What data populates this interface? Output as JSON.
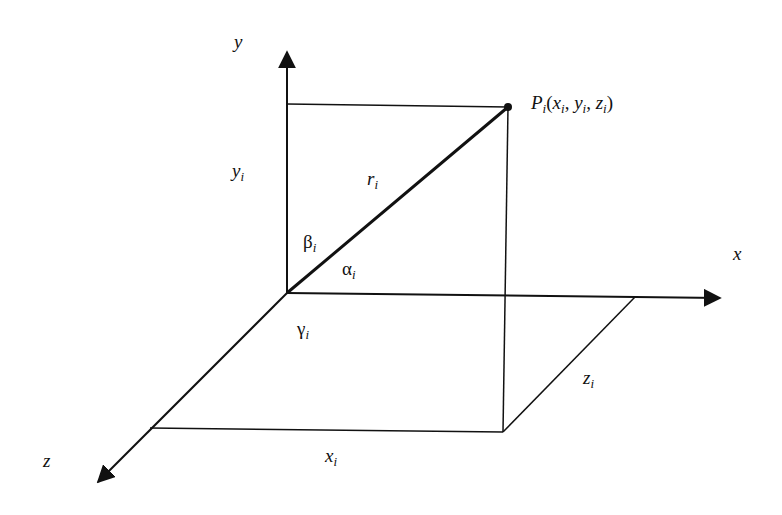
{
  "diagram": {
    "type": "3d-coordinate-system",
    "colors": {
      "line": "#111111",
      "background": "#ffffff"
    },
    "axes": {
      "x": {
        "label": "x"
      },
      "y": {
        "label": "y"
      },
      "z": {
        "label": "z"
      }
    },
    "point": {
      "name": "P",
      "subscript": "i",
      "label_args": "(x",
      "full_label": "Pi(xi, yi, zi)"
    },
    "vector": {
      "label": "r",
      "subscript": "i"
    },
    "angles": {
      "alpha": {
        "symbol": "α",
        "subscript": "i"
      },
      "beta": {
        "symbol": "β",
        "subscript": "i"
      },
      "gamma": {
        "symbol": "γ",
        "subscript": "i"
      }
    },
    "components": {
      "x": {
        "symbol": "x",
        "subscript": "i"
      },
      "y": {
        "symbol": "y",
        "subscript": "i"
      },
      "z": {
        "symbol": "z",
        "subscript": "i"
      }
    },
    "point_label_parts": {
      "p": "P",
      "p_sub": "i",
      "open": "(",
      "x": "x",
      "x_sub": "i",
      "comma1": ", ",
      "y": "y",
      "y_sub": "i",
      "comma2": ", ",
      "z": "z",
      "z_sub": "i",
      "close": ")"
    }
  }
}
